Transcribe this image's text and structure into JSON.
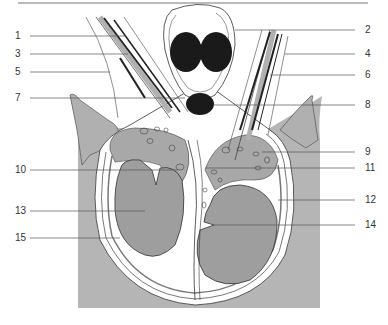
{
  "figure": {
    "type": "anatomical cross-section diagram",
    "colors": {
      "tissue_gray": "#b5b5b5",
      "organ_gray": "#9e9e9e",
      "dark_structure": "#1a1a1a",
      "line": "#333333",
      "background": "#ffffff"
    },
    "labels_left": [
      {
        "id": "1",
        "text": "1",
        "y": 36
      },
      {
        "id": "3",
        "text": "3",
        "y": 54
      },
      {
        "id": "5",
        "text": "5",
        "y": 72
      },
      {
        "id": "7",
        "text": "7",
        "y": 98
      },
      {
        "id": "10",
        "text": "10",
        "y": 170
      },
      {
        "id": "13",
        "text": "13",
        "y": 211
      },
      {
        "id": "15",
        "text": "15",
        "y": 238
      }
    ],
    "labels_right": [
      {
        "id": "2",
        "text": "2",
        "y": 30
      },
      {
        "id": "4",
        "text": "4",
        "y": 54
      },
      {
        "id": "6",
        "text": "6",
        "y": 75
      },
      {
        "id": "8",
        "text": "8",
        "y": 105
      },
      {
        "id": "9",
        "text": "9",
        "y": 152
      },
      {
        "id": "11",
        "text": "11",
        "y": 168
      },
      {
        "id": "12",
        "text": "12",
        "y": 200
      },
      {
        "id": "14",
        "text": "14",
        "y": 225
      }
    ]
  }
}
